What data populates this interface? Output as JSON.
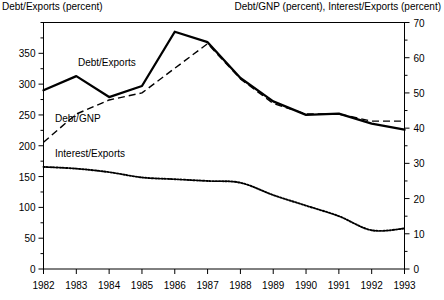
{
  "chart_data": {
    "type": "line",
    "title": "",
    "left_axis_title": "Debt/Exports (percent)",
    "right_axis_title": "Debt/GNP (percent), Interest/Exports (percent)",
    "xlabel": "",
    "x": [
      1982,
      1983,
      1984,
      1985,
      1986,
      1987,
      1988,
      1989,
      1990,
      1991,
      1992,
      1993
    ],
    "xticklabels": [
      "1982",
      "1983",
      "1984",
      "1985",
      "1986",
      "1987",
      "1988",
      "1989",
      "1990",
      "1991",
      "1992",
      "1993"
    ],
    "xlim": [
      1982,
      1993
    ],
    "grid": false,
    "legend": "inline-labels",
    "left_axis": {
      "label": "Debt/Exports (percent)",
      "ylim": [
        0,
        400
      ],
      "ticks": [
        0,
        50,
        100,
        150,
        200,
        250,
        300,
        350
      ],
      "ticklabels": [
        "0",
        "50",
        "100",
        "150",
        "200",
        "250",
        "300",
        "350"
      ],
      "minor_tick_step": 25
    },
    "right_axis": {
      "label": "Debt/GNP (percent), Interest/Exports (percent)",
      "ylim": [
        0,
        70
      ],
      "ticks": [
        0,
        10,
        20,
        30,
        40,
        50,
        60,
        70
      ],
      "ticklabels": [
        "0",
        "10",
        "20",
        "30",
        "40",
        "50",
        "60",
        "70"
      ],
      "minor_tick_step": 5
    },
    "series": [
      {
        "name": "Debt/Exports",
        "label": "Debt/Exports",
        "axis": "left",
        "style": "solid",
        "color": "#000000",
        "values": [
          290,
          313,
          279,
          297,
          385,
          368,
          310,
          272,
          250,
          252,
          236,
          226
        ]
      },
      {
        "name": "Debt/GNP",
        "label": "Debt/GNP",
        "axis": "right",
        "style": "dashed",
        "color": "#000000",
        "values": [
          36,
          44,
          48,
          50,
          57,
          64,
          54,
          47,
          44,
          44,
          42,
          42
        ]
      },
      {
        "name": "Interest/Exports",
        "label": "Interest/Exports",
        "axis": "right",
        "style": "dotted",
        "color": "#000000",
        "values": [
          29,
          28.5,
          27.5,
          26,
          25.5,
          25,
          24.5,
          21,
          18,
          15,
          11,
          11.5
        ]
      }
    ],
    "annotations": [
      {
        "text": "Debt/Exports",
        "x": 1983.05,
        "y_left": 330
      },
      {
        "text": "Debt/GNP",
        "x": 1982.35,
        "y_left": 238
      },
      {
        "text": "Interest/Exports",
        "x": 1982.35,
        "y_left": 182
      }
    ]
  }
}
